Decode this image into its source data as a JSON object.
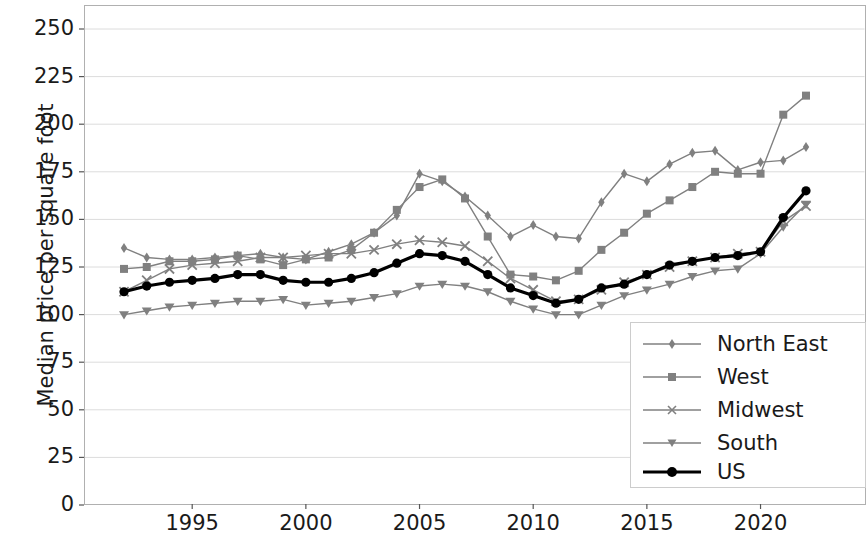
{
  "chart_data": {
    "type": "line",
    "title": "",
    "xlabel": "",
    "ylabel": "Median price per square foot",
    "xlim": [
      1991.5,
      2022.5
    ],
    "ylim": [
      0,
      258
    ],
    "grid": true,
    "legend_position": "lower right",
    "yticks": [
      0,
      25,
      50,
      75,
      100,
      125,
      150,
      175,
      200,
      225,
      250
    ],
    "xticks": [
      1995,
      2000,
      2005,
      2010,
      2015,
      2020
    ],
    "x": [
      1992,
      1993,
      1994,
      1995,
      1996,
      1997,
      1998,
      1999,
      2000,
      2001,
      2002,
      2003,
      2004,
      2005,
      2006,
      2007,
      2008,
      2009,
      2010,
      2011,
      2012,
      2013,
      2014,
      2015,
      2016,
      2017,
      2018,
      2019,
      2020,
      2021,
      2022
    ],
    "series": [
      {
        "name": "North East",
        "marker": "thin-diamond",
        "color": "#808080",
        "values": [
          135,
          130,
          129,
          129,
          130,
          131,
          132,
          130,
          129,
          133,
          137,
          143,
          152,
          174,
          170,
          162,
          152,
          141,
          147,
          141,
          140,
          159,
          174,
          170,
          179,
          185,
          186,
          176,
          180,
          181,
          188
        ]
      },
      {
        "name": "West",
        "marker": "square",
        "color": "#808080",
        "values": [
          124,
          125,
          128,
          128,
          129,
          131,
          129,
          126,
          129,
          130,
          134,
          143,
          155,
          167,
          171,
          161,
          141,
          121,
          120,
          118,
          123,
          134,
          143,
          153,
          160,
          167,
          175,
          174,
          174,
          205,
          215
        ]
      },
      {
        "name": "Midwest",
        "marker": "x",
        "color": "#808080",
        "values": [
          112,
          118,
          124,
          126,
          127,
          128,
          130,
          130,
          131,
          132,
          132,
          134,
          137,
          139,
          138,
          136,
          128,
          119,
          113,
          107,
          108,
          113,
          117,
          121,
          125,
          128,
          130,
          132,
          133,
          149,
          157
        ]
      },
      {
        "name": "South",
        "marker": "triangle-down",
        "color": "#808080",
        "values": [
          100,
          102,
          104,
          105,
          106,
          107,
          107,
          108,
          105,
          106,
          107,
          109,
          111,
          115,
          116,
          115,
          112,
          107,
          103,
          100,
          100,
          105,
          110,
          113,
          116,
          120,
          123,
          124,
          132,
          146,
          158
        ]
      },
      {
        "name": "US",
        "marker": "circle",
        "color": "#000000",
        "values": [
          112,
          115,
          117,
          118,
          119,
          121,
          121,
          118,
          117,
          117,
          119,
          122,
          127,
          132,
          131,
          128,
          121,
          114,
          110,
          106,
          108,
          114,
          116,
          121,
          126,
          128,
          130,
          131,
          133,
          151,
          165
        ]
      }
    ]
  },
  "axes": {
    "ylabel": "Median price per square foot",
    "ytick_labels": [
      "0",
      "25",
      "50",
      "75",
      "100",
      "125",
      "150",
      "175",
      "200",
      "225",
      "250"
    ],
    "xtick_labels": [
      "1995",
      "2000",
      "2005",
      "2010",
      "2015",
      "2020"
    ]
  },
  "legend": {
    "items": [
      {
        "label": "North East"
      },
      {
        "label": "West"
      },
      {
        "label": "Midwest"
      },
      {
        "label": "South"
      },
      {
        "label": "US"
      }
    ]
  }
}
